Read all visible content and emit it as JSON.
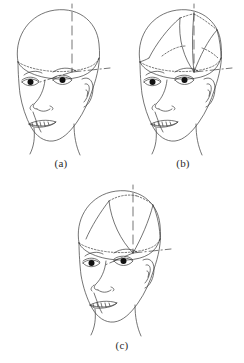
{
  "figure": {
    "type": "line-art-diagram",
    "background_color": "#ffffff",
    "line_color": "#3a3a3a",
    "iris_color": "#111111",
    "panel_count": 3
  },
  "panels": [
    {
      "id": "a",
      "caption": "(a)",
      "description": "head with horizontal parting ellipse and central axis guide lines",
      "sections": 0,
      "guides": [
        "vertical-axis",
        "horizontal-axis",
        "parting-ellipse"
      ]
    },
    {
      "id": "b",
      "caption": "(b)",
      "description": "head with multiple radial hair sections converging at the crown",
      "sections": 4,
      "guides": [
        "vertical-axis",
        "horizontal-axis",
        "parting-ellipse"
      ]
    },
    {
      "id": "c",
      "caption": "(c)",
      "description": "head with a single central panel hair section",
      "sections": 1,
      "guides": [
        "vertical-axis",
        "horizontal-axis",
        "parting-ellipse"
      ]
    }
  ],
  "captions": {
    "a": "(a)",
    "b": "(b)",
    "c": "(c)"
  }
}
